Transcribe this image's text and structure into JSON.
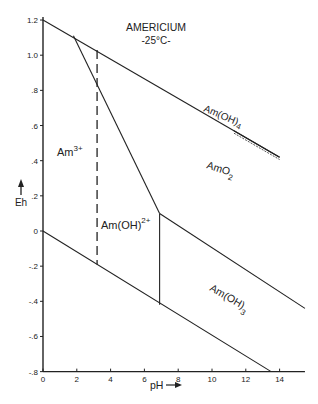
{
  "chart_data": {
    "type": "line",
    "title": "AMERICIUM",
    "subtitle": "-25°C-",
    "xlabel": "pH",
    "ylabel": "Eh",
    "xlim": [
      0,
      15.5
    ],
    "ylim": [
      -0.8,
      1.2
    ],
    "grid": false,
    "legend": "none",
    "x_ticks": [
      0,
      2,
      4,
      6,
      8,
      10,
      12,
      14
    ],
    "x_tick_labels": [
      "0",
      "2",
      "4",
      "6",
      "8",
      "10",
      "12",
      "14"
    ],
    "y_ticks": [
      1.2,
      1.0,
      0.8,
      0.6,
      0.4,
      0.2,
      0,
      -0.2,
      -0.4,
      -0.6,
      -0.8
    ],
    "y_tick_labels": [
      "1.2",
      "1.0",
      ".8",
      ".6",
      ".4",
      ".2",
      "0",
      "-.2",
      "-.4",
      "-.6",
      "-.8"
    ],
    "series": [
      {
        "name": "O2/H2O upper stability limit",
        "style": "solid",
        "points": [
          [
            0,
            1.2
          ],
          [
            14,
            0.42
          ]
        ]
      },
      {
        "name": "H2O/H2 lower stability limit",
        "style": "solid",
        "points": [
          [
            0,
            0.0
          ],
          [
            13.5,
            -0.8
          ]
        ]
      },
      {
        "name": "Am3+ / AmO2 boundary",
        "style": "solid",
        "points": [
          [
            1.8,
            1.11
          ],
          [
            6.9,
            0.1
          ]
        ]
      },
      {
        "name": "Am3+ / Am(OH)2+ boundary",
        "style": "dashed",
        "points": [
          [
            3.2,
            1.03
          ],
          [
            3.2,
            -0.19
          ]
        ]
      },
      {
        "name": "Am(OH)2+ / Am(OH)3 boundary",
        "style": "solid",
        "points": [
          [
            6.9,
            0.1
          ],
          [
            6.9,
            -0.42
          ]
        ]
      },
      {
        "name": "AmO2 / Am(OH)3 boundary",
        "style": "solid",
        "points": [
          [
            6.9,
            0.1
          ],
          [
            15.5,
            -0.44
          ]
        ]
      },
      {
        "name": "Am(OH)4 boundary",
        "style": "double",
        "points": [
          [
            11.3,
            0.57
          ],
          [
            14,
            0.42
          ]
        ]
      }
    ],
    "annotations": [
      {
        "text": "Am",
        "sup": "3+",
        "x": 0.9,
        "y": 0.4
      },
      {
        "text": "Am(OH)",
        "sup": "2+",
        "x": 3.5,
        "y": -0.02
      },
      {
        "text": "AmO",
        "sub": "2",
        "x": 9.0,
        "y": 0.3
      },
      {
        "text": "Am(OH)",
        "sub": "4",
        "x": 11.3,
        "y": 0.62,
        "rotated": true
      },
      {
        "text": "Am(OH)",
        "sub": "3",
        "x": 9.8,
        "y": -0.32,
        "rotated": true
      }
    ]
  },
  "labels": {
    "title": "AMERICIUM",
    "subtitle": "-25°C-",
    "xlabel": "pH",
    "ylabel": "Eh",
    "am3": "Am",
    "am3_sup": "3+",
    "amoh2": "Am(OH)",
    "amoh2_sup": "2+",
    "amo2": "AmO",
    "amo2_sub": "2",
    "amoh4": "Am(OH)",
    "amoh4_sub": "4",
    "amoh3": "Am(OH)",
    "amoh3_sub": "3"
  },
  "colors": {
    "ink": "#222222",
    "background": "#ffffff"
  }
}
